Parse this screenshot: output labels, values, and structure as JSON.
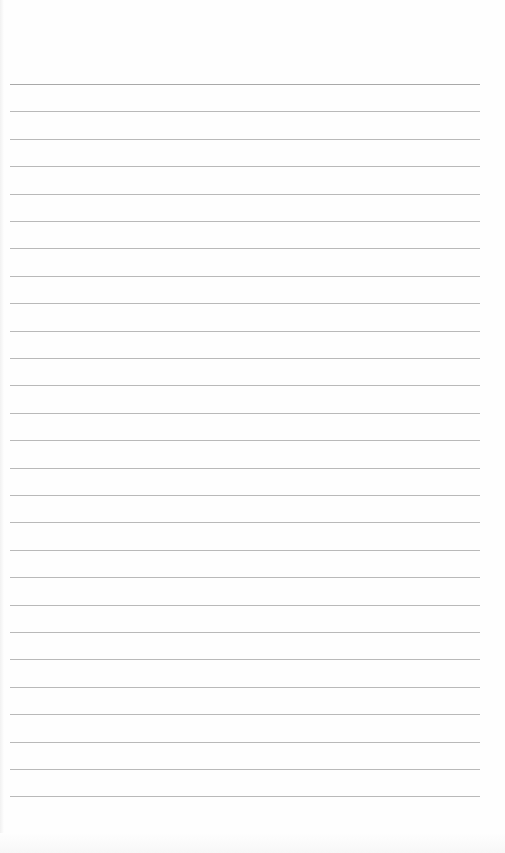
{
  "page": {
    "type": "lined-notebook-page",
    "background_color": "#fefefe",
    "rule_color": "#b9b9b9",
    "first_rule_color": "#a9a9a9",
    "rule_count": 27,
    "first_rule_y": 84,
    "rule_spacing": 27.4,
    "rule_left": 10,
    "rule_width": 470,
    "text": ""
  }
}
